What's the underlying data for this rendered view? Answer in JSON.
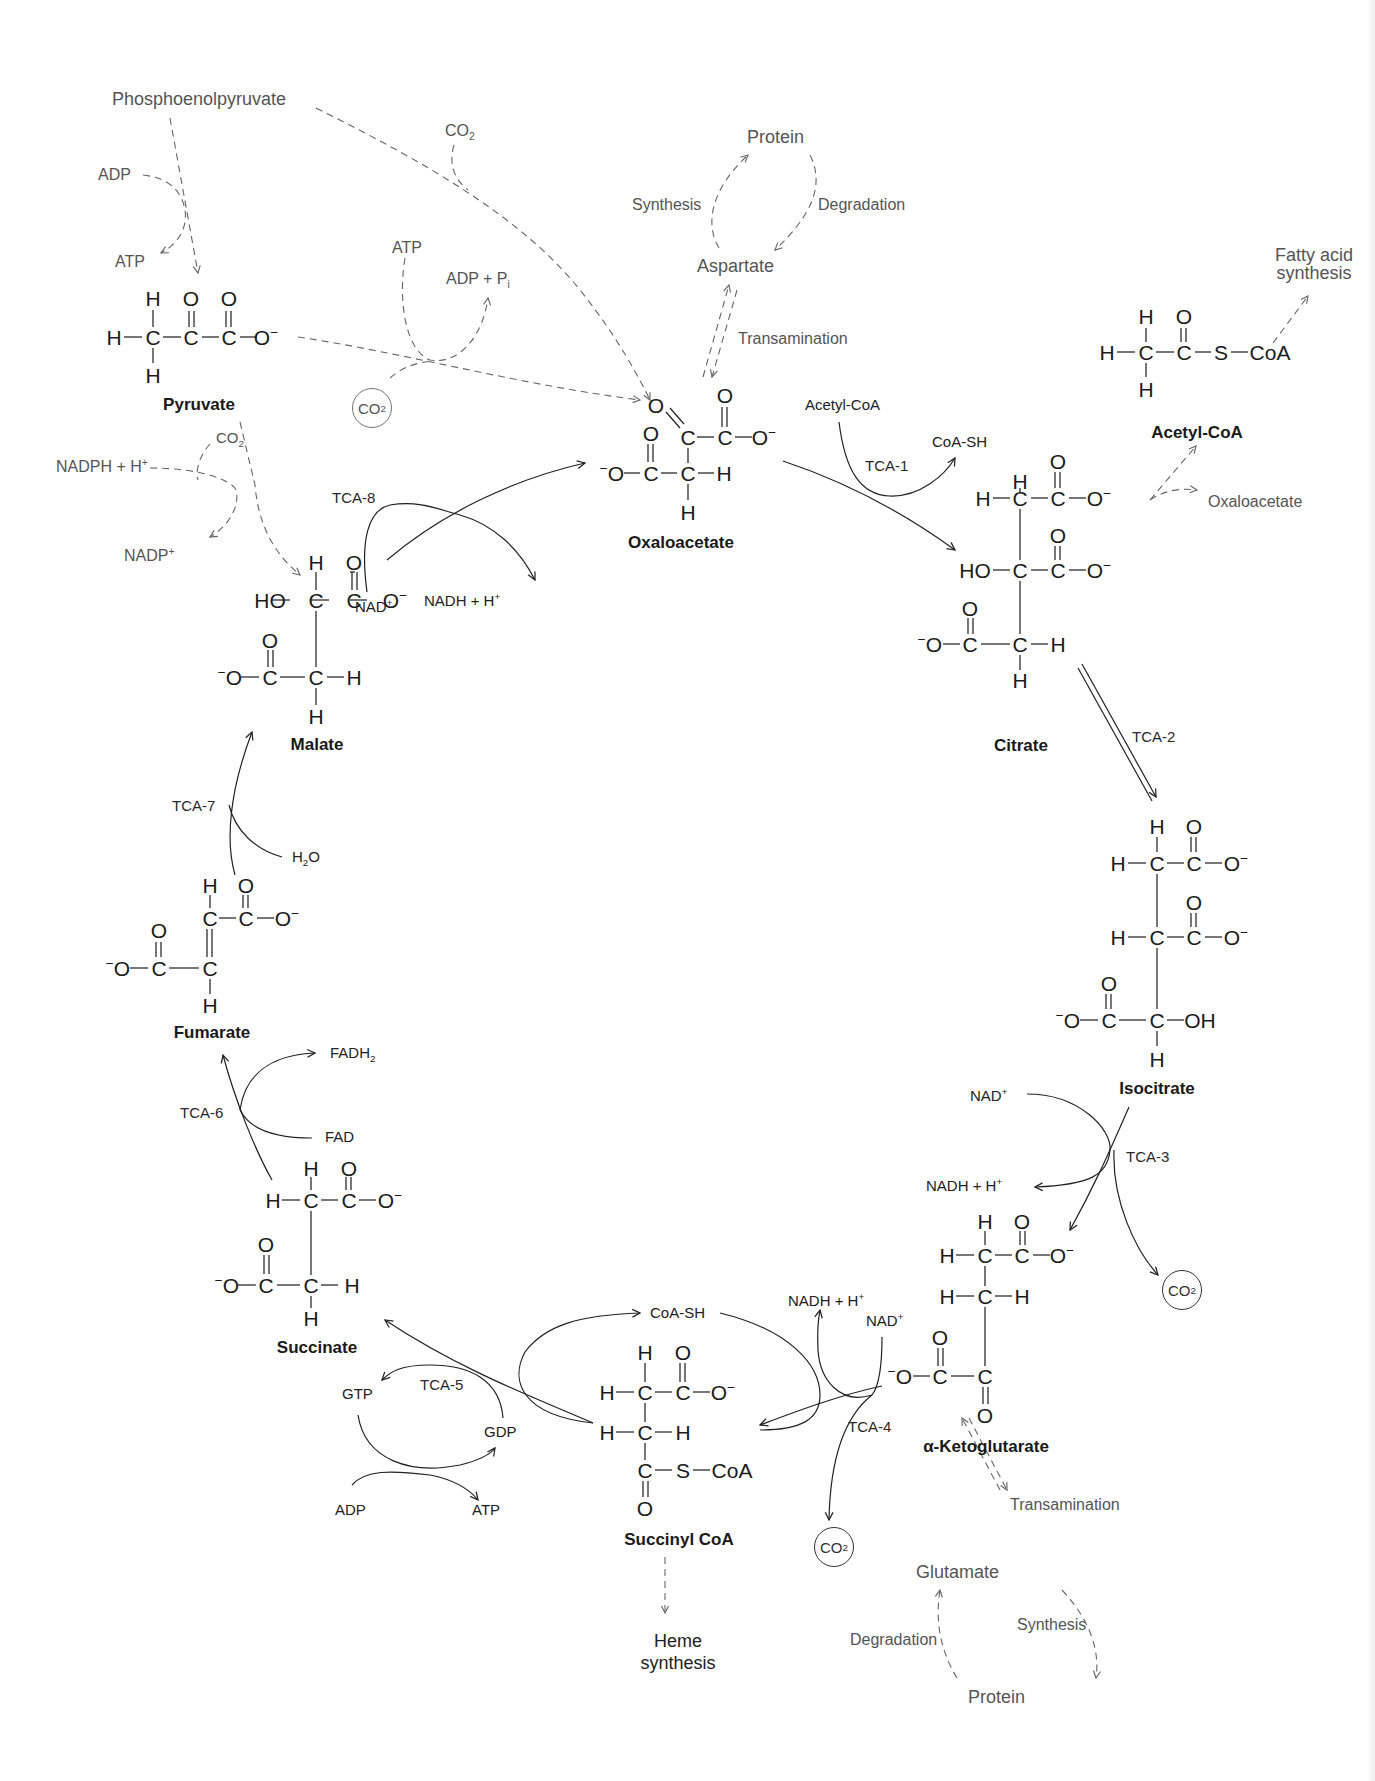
{
  "diagram": {
    "colors": {
      "line": "#222222",
      "gray_line": "#666666",
      "text": "#1b1b1b",
      "gray_text": "#555555",
      "background": "#ffffff"
    },
    "compounds": {
      "pyruvate": {
        "name": "Pyruvate",
        "formula": "H3C-CO-COO-"
      },
      "oxaloacetate": {
        "name": "Oxaloacetate"
      },
      "citrate": {
        "name": "Citrate"
      },
      "isocitrate": {
        "name": "Isocitrate"
      },
      "alpha_ketoglutarate": {
        "name": "α-Ketoglutarate"
      },
      "succinyl_coa": {
        "name": "Succinyl CoA"
      },
      "succinate": {
        "name": "Succinate"
      },
      "fumarate": {
        "name": "Fumarate"
      },
      "malate": {
        "name": "Malate"
      },
      "acetyl_coa": {
        "name": "Acetyl-CoA"
      }
    },
    "side_labels": {
      "phosphoenolpyruvate": "Phosphoenolpyruvate",
      "adp_pep": "ADP",
      "atp_pep": "ATP",
      "co2_top": "CO",
      "atp_pc": "ATP",
      "adp_pi": "ADP + P",
      "pi_sub": "i",
      "co2_circled_pc": "CO",
      "protein_top": "Protein",
      "synthesis_top": "Synthesis",
      "degradation_top": "Degradation",
      "aspartate": "Aspartate",
      "transamination_top": "Transamination",
      "acetyl_coa_in": "Acetyl-CoA",
      "coa_sh_1": "CoA-SH",
      "fatty_acid_1": "Fatty acid",
      "fatty_acid_2": "synthesis",
      "oxaloacetate_right": "Oxaloacetate",
      "nadph": "NADPH + H",
      "co2_malic": "CO",
      "nadp": "NADP",
      "nad_8": "NAD",
      "nadh_8": "NADH + H",
      "h2o": "H",
      "fadh2": "FADH",
      "fad": "FAD",
      "nad_3": "NAD",
      "nadh_3": "NADH + H",
      "co2_3": "CO",
      "nadh_4": "NADH + H",
      "nad_4": "NAD",
      "co2_4": "CO",
      "coa_sh_4": "CoA-SH",
      "gtp": "GTP",
      "gdp": "GDP",
      "adp_5": "ADP",
      "atp_5": "ATP",
      "heme_1": "Heme",
      "heme_2": "synthesis",
      "glutamate": "Glutamate",
      "transamination_bottom": "Transamination",
      "degradation_bottom": "Degradation",
      "synthesis_bottom": "Synthesis",
      "protein_bottom": "Protein"
    },
    "enzymes": {
      "tca1": "TCA-1",
      "tca2": "TCA-2",
      "tca3": "TCA-3",
      "tca4": "TCA-4",
      "tca5": "TCA-5",
      "tca6": "TCA-6",
      "tca7": "TCA-7",
      "tca8": "TCA-8"
    },
    "glyphs": {
      "plus": "+",
      "minus": "−",
      "two": "2",
      "h2o_o": "O"
    }
  }
}
